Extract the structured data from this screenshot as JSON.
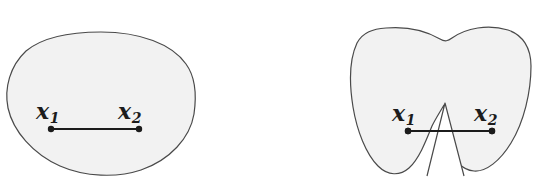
{
  "figure": {
    "background_color": "#ffffff",
    "shape_fill_color": "#f2f2f2",
    "shape_stroke_color": "#4a4a4a",
    "segment_color": "#1c1c1c",
    "label_color": "#1c1c1c"
  },
  "panels": [
    {
      "id": "convex-set",
      "shape_name": "rounded-blob",
      "point_labels": {
        "first": "x",
        "first_sub": "1",
        "second": "x",
        "second_sub": "2"
      },
      "segment": {
        "x1": 51,
        "y1": 129,
        "x2": 139,
        "y2": 129
      },
      "label_positions": {
        "first_x": 36,
        "first_y": 100,
        "second_x": 118,
        "second_y": 100
      },
      "blob_path": "M 101 32 C 140 32 172 44 186 64 C 197 79 196 100 194 114 C 190 138 170 160 141 170 C 117 178 85 177 60 166 C 33 154 13 131 8 108 C 4 88 10 66 26 51 C 44 36 72 32 101 32 Z",
      "shape_bounds": {
        "left": 7,
        "top": 31,
        "right": 195,
        "bottom": 176
      }
    },
    {
      "id": "nonconvex-set",
      "shape_name": "notched-blob",
      "point_labels": {
        "first": "x",
        "first_sub": "1",
        "second": "x",
        "second_sub": "2"
      },
      "segment": {
        "x1": 408,
        "y1": 131,
        "x2": 492,
        "y2": 131
      },
      "label_positions": {
        "first_x": 392,
        "first_y": 102,
        "second_x": 474,
        "second_y": 102
      },
      "blob_path": "M 386 28 C 410 26 428 32 440 39 C 445 42 448 41 452 38 C 466 28 488 24 508 30 C 523 35 531 48 531 66 C 531 92 524 122 511 143 C 500 161 486 172 474 171 C 461 170 452 157 447 141 C 444 130 443 118 444 105 C 440 112 436 118 432 126 C 426 141 419 159 409 168 C 400 176 388 176 378 166 C 366 154 357 131 353 107 C 349 82 350 58 357 43 C 363 32 373 29 386 28 Z",
      "notch": {
        "apex_x": 445,
        "apex_y": 103,
        "left_base_x": 427,
        "right_base_x": 464,
        "base_y": 176
      },
      "shape_bounds": {
        "left": 350,
        "top": 26,
        "right": 531,
        "bottom": 176
      }
    }
  ]
}
